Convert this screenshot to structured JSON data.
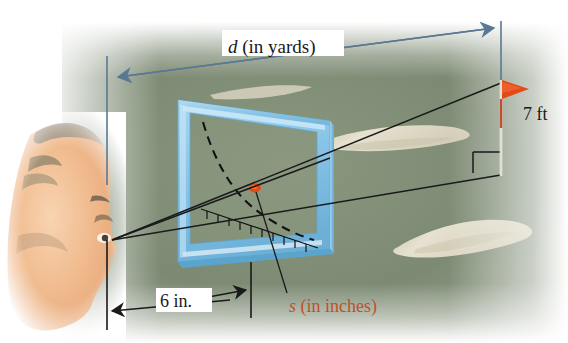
{
  "figure": {
    "labels": {
      "distance": {
        "symbol": "d",
        "unit_text": "(in yards)",
        "full": "d (in yards)"
      },
      "flag_height": {
        "full": "7 ft",
        "value": 7,
        "unit": "ft"
      },
      "eye_to_card": {
        "full": "6 in.",
        "value": 6,
        "unit": "in."
      },
      "scale_reading": {
        "symbol": "s",
        "unit_text": "(in inches)",
        "full": "s (in inches)"
      }
    },
    "colors": {
      "frame_blue": "#8ec7e8",
      "frame_blue_dark": "#5fa8d0",
      "fairway_green": "#7e8c74",
      "fairway_green_dark": "#6a7a62",
      "sand_cream": "#ddd8c4",
      "flag_orange": "#e34a18",
      "label_orange": "#c1502a",
      "dimension_blue": "#5a7894",
      "line_black": "#1a1a1a",
      "skin": "#f0bb8e",
      "hair": "#8a7a66",
      "page_white": "#ffffff"
    },
    "elements": {
      "face": "profile-head-left",
      "card": "blue-rectangular-frame",
      "curve": "dashed-calibration-curve",
      "ruler": "tick-mark-scale",
      "marker": "red-dot-on-scale",
      "flag": "golf-flag-on-pole",
      "right_angle": "right-angle-marker",
      "sight_lines": "eye-to-flag-sight-lines"
    }
  }
}
